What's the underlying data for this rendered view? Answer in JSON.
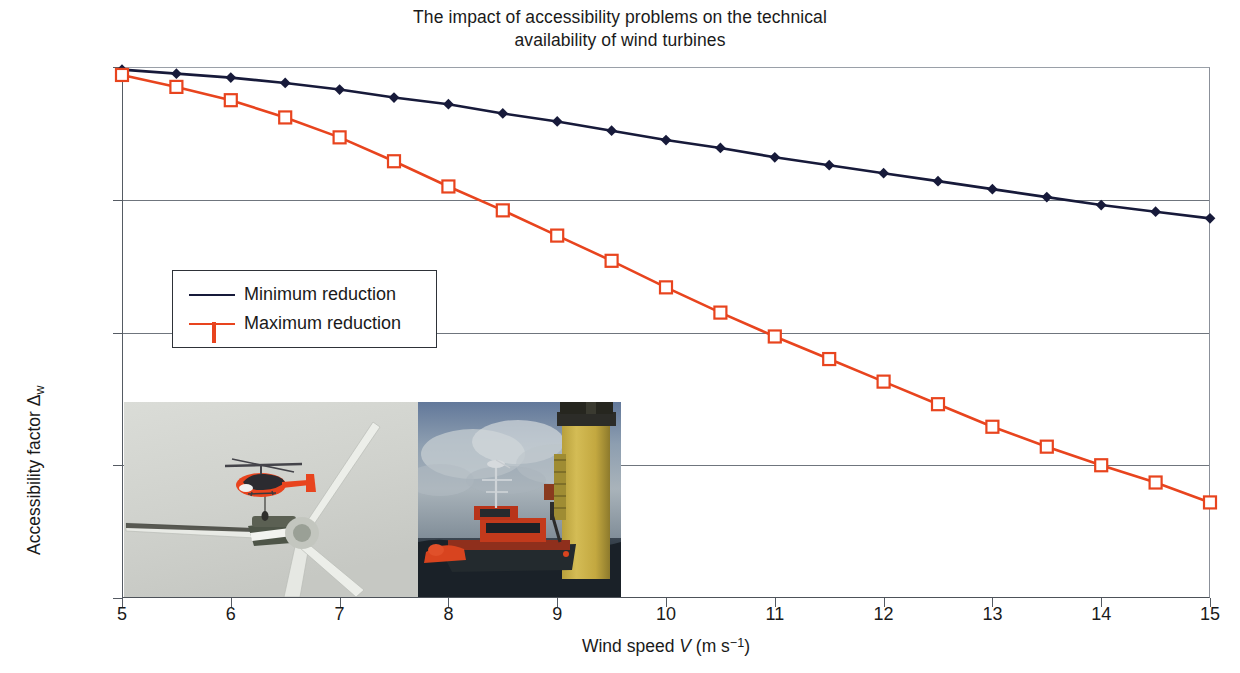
{
  "chart_data": {
    "type": "line",
    "title_lines": [
      "The impact of accessibility problems on the technical",
      "availability of wind turbines"
    ],
    "title": "The impact of accessibility problems on the technical availability of wind turbines",
    "xlabel_prefix": "Wind speed ",
    "xlabel_var": "V",
    "xlabel_unit_open": " (m s",
    "xlabel_unit_exp": "−1",
    "xlabel_unit_close": ")",
    "xlabel": "Wind speed V (m s−1)",
    "ylabel_prefix": "Accessibility factor ",
    "ylabel_symbol": "Δ",
    "ylabel_sub": "w",
    "ylabel": "Accessibility factor Δw",
    "xlim": [
      5,
      15
    ],
    "ylim": [
      60,
      100
    ],
    "grid": "horizontal",
    "legend_position": "inside-left",
    "x_ticks": [
      "5",
      "6",
      "7",
      "8",
      "9",
      "10",
      "11",
      "12",
      "13",
      "14",
      "15"
    ],
    "x_tick_values": [
      5,
      6,
      7,
      8,
      9,
      10,
      11,
      12,
      13,
      14,
      15
    ],
    "y_ticks": [
      "60%",
      "70%",
      "80%",
      "90%",
      "100%"
    ],
    "y_tick_values": [
      60,
      70,
      80,
      90,
      100
    ],
    "x": [
      5,
      5.5,
      6,
      6.5,
      7,
      7.5,
      8,
      8.5,
      9,
      9.5,
      10,
      10.5,
      11,
      11.5,
      12,
      12.5,
      13,
      13.5,
      14,
      14.5,
      15
    ],
    "series": [
      {
        "name": "Minimum reduction",
        "color": "#171a3a",
        "marker": "diamond-filled",
        "values": [
          99.8,
          99.5,
          99.2,
          98.8,
          98.3,
          97.7,
          97.2,
          96.5,
          95.9,
          95.2,
          94.5,
          93.9,
          93.2,
          92.6,
          92.0,
          91.4,
          90.8,
          90.2,
          89.6,
          89.1,
          88.6
        ]
      },
      {
        "name": "Maximum reduction",
        "color": "#e8441e",
        "marker": "square-open",
        "values": [
          99.4,
          98.5,
          97.5,
          94.7,
          92.9,
          91.0,
          89.2,
          87.3,
          85.4,
          83.4,
          81.5,
          79.7,
          78.0,
          76.3,
          74.6,
          72.9,
          71.4,
          70.0,
          68.7,
          67.2,
          67.2
        ]
      }
    ],
    "series_min_x": [
      5,
      5.5,
      6,
      6.5,
      7,
      7.5,
      8,
      8.5,
      9,
      9.5,
      10,
      10.5,
      11,
      11.5,
      12,
      12.5,
      13,
      13.5,
      14,
      14.5,
      15
    ],
    "series_min_y": [
      99.8,
      99.5,
      99.2,
      98.8,
      98.3,
      97.7,
      97.2,
      96.5,
      95.9,
      95.2,
      94.5,
      93.9,
      93.2,
      92.6,
      92.0,
      91.4,
      90.8,
      90.2,
      89.6,
      89.1,
      88.6
    ],
    "series_max_x": [
      5,
      5.5,
      6,
      6.5,
      7,
      7.5,
      8,
      8.5,
      9,
      9.5,
      10,
      10.5,
      11,
      11.5,
      12,
      12.5,
      13,
      13.5,
      14,
      14.5,
      15
    ],
    "series_max_y": [
      99.4,
      98.5,
      97.5,
      96.2,
      94.7,
      92.9,
      91.0,
      89.2,
      87.3,
      85.4,
      83.4,
      81.5,
      79.7,
      78.0,
      76.3,
      74.6,
      72.9,
      71.4,
      70.0,
      68.7,
      67.2
    ]
  },
  "legend": {
    "items": [
      {
        "label": "Minimum reduction",
        "color": "#171a3a",
        "marker": "diamond-filled"
      },
      {
        "label": "Maximum reduction",
        "color": "#e8441e",
        "marker": "square-open"
      }
    ]
  },
  "photos": [
    {
      "name": "helicopter-over-wind-turbine-nacelle",
      "caption": ""
    },
    {
      "name": "service-vessel-at-offshore-turbine-foundation",
      "caption": ""
    }
  ],
  "colors": {
    "minimum_series": "#171a3a",
    "maximum_series": "#e8441e",
    "axis": "#555b63",
    "grid": "#6f757d",
    "text": "#1a1a1a",
    "background": "#ffffff"
  }
}
